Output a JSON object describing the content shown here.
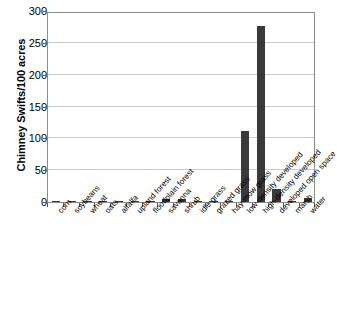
{
  "chart_data": {
    "type": "bar",
    "title": "",
    "xlabel": "",
    "ylabel": "Chimney Swifts/100 acres",
    "ylim": [
      0,
      300
    ],
    "yticks": [
      0,
      50,
      100,
      150,
      200,
      250,
      300
    ],
    "grid": true,
    "legend": "none",
    "bar_color": "#3a3a3a",
    "categories": [
      "corn",
      "soybeans",
      "wheat",
      "oats",
      "alfalfa",
      "upland forest",
      "floodplain forest",
      "savanna",
      "shrub",
      "idle grass",
      "grazed grass",
      "hay-mow grass",
      "low-density developed",
      "high-density developed",
      "developed open space",
      "marsh",
      "water"
    ],
    "values": [
      1,
      2,
      1,
      1,
      1,
      2,
      1,
      5,
      5,
      1,
      1,
      1,
      112,
      277,
      21,
      1,
      6
    ]
  },
  "axes": {
    "y_title": "Chimney Swifts/100 acres",
    "y_tick_labels": [
      "0",
      "50",
      "100",
      "150",
      "200",
      "250",
      "300"
    ]
  }
}
